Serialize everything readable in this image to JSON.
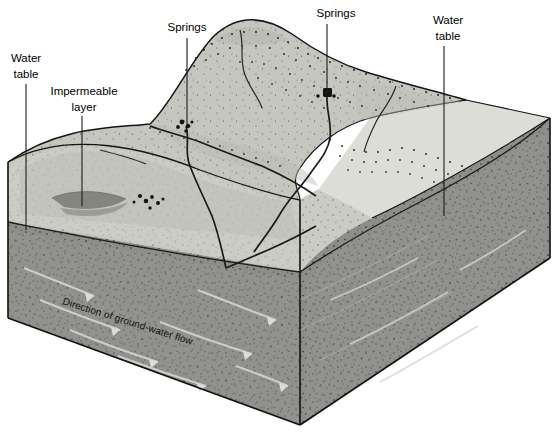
{
  "figure": {
    "type": "block-diagram",
    "background_color": "#ffffff"
  },
  "labels": {
    "water_table_left_line1": "Water",
    "water_table_left_line2": "table",
    "impermeable_line1": "Impermeable",
    "impermeable_line2": "layer",
    "springs_left": "Springs",
    "springs_right": "Springs",
    "water_table_right_line1": "Water",
    "water_table_right_line2": "table",
    "flow_caption": "Direction of ground-water flow"
  },
  "colors": {
    "unsaturated_zone": "#cfcfcb",
    "saturated_zone": "#8f8f8c",
    "terrain_top": "#c9c9c4",
    "terrain_shadow": "#b4b4af",
    "block_top_light": "#dedad4",
    "right_face_upper": "#bcbcb7",
    "outline": "#111111",
    "impermeable_lens": "#555550",
    "leader_line": "#1a1a1a",
    "text": "#000000"
  },
  "annotations": [
    {
      "name": "spring-left",
      "x": 186,
      "y": 124
    },
    {
      "name": "spring-right",
      "x": 327,
      "y": 93
    },
    {
      "name": "water-table-left-leader-end",
      "x": 26,
      "y": 228
    },
    {
      "name": "impermeable-leader-end",
      "x": 82,
      "y": 205
    },
    {
      "name": "water-table-right-leader-end",
      "x": 444,
      "y": 213
    }
  ],
  "geometry": {
    "block_left_edge_x": 8,
    "block_front_corner_x": 300,
    "block_right_corner_x": 550,
    "top_surface_back_y": 30,
    "bottom_front_y": 425
  }
}
